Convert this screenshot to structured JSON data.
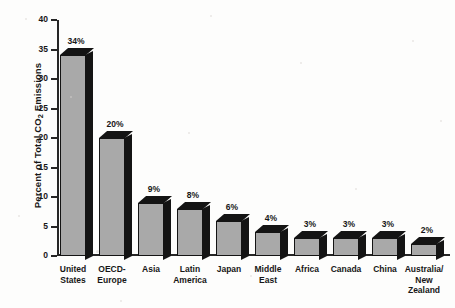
{
  "chart_data": {
    "type": "bar",
    "title": "",
    "subtitle": "",
    "xlabel": "",
    "ylabel": "Percent of Total CO2 Emissions",
    "ylabel_parts": {
      "pre": "Percent of Total CO",
      "sub": "2",
      "post": " Emissions"
    },
    "ylim": [
      0,
      40
    ],
    "ytick_step": 5,
    "yticks": [
      40,
      35,
      30,
      25,
      20,
      15,
      10,
      5,
      0
    ],
    "ytick_labels": [
      "40",
      "35",
      "30",
      "25",
      "20",
      "15",
      "10",
      "5",
      "0"
    ],
    "grid": false,
    "legend": null,
    "value_label_suffix": "%",
    "categories": [
      "United States",
      "OECD-Europe",
      "Asia",
      "Latin America",
      "Japan",
      "Middle East",
      "Africa",
      "Canada",
      "China",
      "Australia/New Zealand"
    ],
    "category_lines": [
      [
        "United",
        "States"
      ],
      [
        "OECD-",
        "Europe"
      ],
      [
        "Asia"
      ],
      [
        "Latin",
        "America"
      ],
      [
        "Japan"
      ],
      [
        "Middle",
        "East"
      ],
      [
        "Africa"
      ],
      [
        "Canada"
      ],
      [
        "China"
      ],
      [
        "Australia/",
        "New",
        "Zealand"
      ]
    ],
    "values": [
      34,
      20,
      9,
      8,
      6,
      4,
      3,
      3,
      3,
      2
    ],
    "value_labels": [
      "34%",
      "20%",
      "9%",
      "8%",
      "6%",
      "4%",
      "3%",
      "3%",
      "3%",
      "2%"
    ],
    "colors": {
      "bar_face": "#a9a9a9",
      "bar_shadow": "#141414",
      "axis": "#262626",
      "text": "#171717",
      "background": "#fdfdfc"
    }
  }
}
